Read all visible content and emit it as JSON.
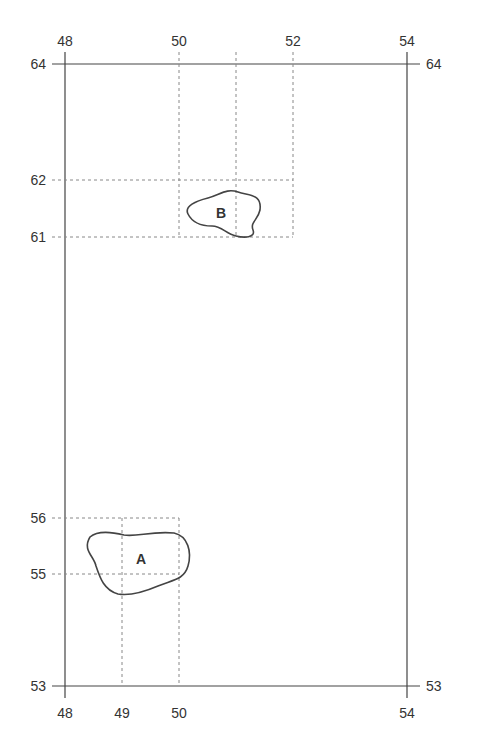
{
  "diagram": {
    "frame": {
      "x_min": 48,
      "x_max": 54,
      "y_min": 53,
      "y_max": 64
    },
    "top_x_labels": [
      "48",
      "50",
      "52",
      "54"
    ],
    "bottom_x_labels": [
      "48",
      "49",
      "50",
      "54"
    ],
    "left_y_labels": [
      "64",
      "62",
      "61",
      "56",
      "55",
      "53"
    ],
    "right_y_labels": [
      "64",
      "53"
    ],
    "regions": [
      {
        "label": "B",
        "grid_x": [
          50,
          52
        ],
        "grid_y": [
          61,
          62
        ]
      },
      {
        "label": "A",
        "grid_x": [
          49,
          50
        ],
        "grid_y": [
          55,
          56
        ]
      }
    ],
    "colors": {
      "line": "#333333",
      "dash": "#888888",
      "text": "#333333"
    }
  }
}
